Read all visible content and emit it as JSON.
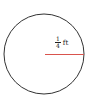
{
  "diagram": {
    "shape": "circle",
    "radius_label": {
      "numerator": "1",
      "denominator": "4",
      "unit": "ft"
    },
    "colors": {
      "circle_stroke": "#333333",
      "radius_line": "#d9544d"
    }
  }
}
